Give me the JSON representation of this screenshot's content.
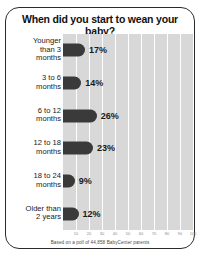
{
  "chart": {
    "title": "When did you start to wean your baby?",
    "footnote": "Based on a poll of 44,858 BabyCenter parents"
  },
  "chart_data": {
    "type": "bar",
    "orientation": "horizontal",
    "title": "When did you start to wean your baby?",
    "categories": [
      "Younger\nthan 3\nmonths",
      "3 to 6\nmonths",
      "6 to 12\nmonths",
      "12 to 18\nmonths",
      "18 to 24\nmonths",
      "Older than\n2 years"
    ],
    "values": [
      17,
      14,
      26,
      23,
      9,
      12
    ],
    "value_labels": [
      "17%",
      "14%",
      "26%",
      "23%",
      "9%",
      "12%"
    ],
    "xlabel": "",
    "ylabel": "",
    "xlim": [
      0,
      100
    ],
    "xticks": [
      10,
      20,
      30,
      40,
      50,
      60,
      70,
      80,
      90,
      100
    ],
    "xtick_labels": [
      "10",
      "20",
      "30",
      "40",
      "50",
      "60",
      "70",
      "80",
      "90",
      "100"
    ],
    "grid": true,
    "grid_orientation": "vertical",
    "legend": false,
    "annotation": "Based on a poll of 44,858 BabyCenter parents",
    "colors": {
      "bar": "#3a3a3a",
      "plot_background": "#d8d8d8",
      "gridline": "#ffffff",
      "border": "#2b2b2b",
      "text": "#1a1a1a"
    }
  }
}
